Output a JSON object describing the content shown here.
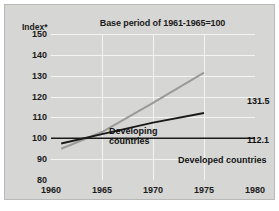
{
  "figure": {
    "title": "Base period of 1961-1965=100",
    "y_axis_label": "Index*"
  },
  "annotations": {
    "developing_label_line1": "Developing",
    "developing_label_line2": "countries",
    "developed_label": "Developed countries",
    "developing_value": "131.5",
    "developed_value": "112.1"
  },
  "chart_data": {
    "type": "line",
    "title": "Base period of 1961-1965=100",
    "xlabel": "",
    "ylabel": "Index*",
    "xlim": [
      1960,
      1980
    ],
    "ylim": [
      80,
      150
    ],
    "xticks": [
      1960,
      1965,
      1970,
      1975,
      1980
    ],
    "yticks": [
      80,
      90,
      100,
      110,
      120,
      130,
      140,
      150
    ],
    "grid": true,
    "legend_position": "inline-annotations",
    "series": [
      {
        "name": "Developing countries",
        "color": "#9a9a98",
        "x": [
          1961,
          1965,
          1970,
          1975
        ],
        "values": [
          95.0,
          103.0,
          117.0,
          131.5
        ],
        "end_label": "131.5"
      },
      {
        "name": "Developed countries",
        "color": "#1a1a1a",
        "x": [
          1961,
          1965,
          1970,
          1975
        ],
        "values": [
          97.5,
          102.0,
          107.5,
          112.1
        ],
        "end_label": "112.1"
      },
      {
        "name": "Base index reference",
        "color": "#1a1a1a",
        "x": [
          1960,
          1980
        ],
        "values": [
          100,
          100
        ],
        "end_label": ""
      }
    ]
  }
}
